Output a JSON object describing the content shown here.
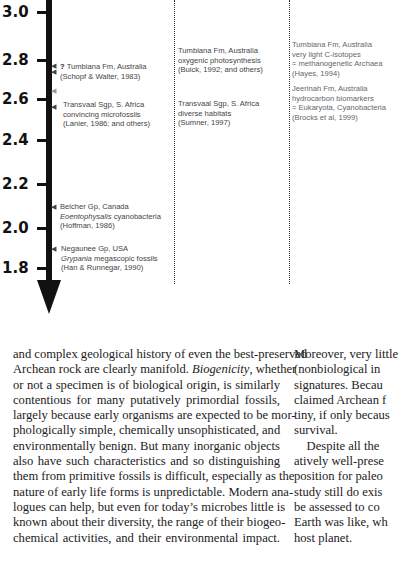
{
  "figure": {
    "axis": {
      "ticks": [
        {
          "label": "3.0",
          "y": 12
        },
        {
          "label": "2.8",
          "y": 60
        },
        {
          "label": "2.6",
          "y": 99
        },
        {
          "label": "2.4",
          "y": 140
        },
        {
          "label": "2.2",
          "y": 184
        },
        {
          "label": "2.0",
          "y": 228
        },
        {
          "label": "1.8",
          "y": 268
        }
      ]
    },
    "column1": {
      "tumbiana": {
        "question_mark": "?",
        "line1": "Tumbiana Fm, Australia",
        "line2": "(Schopf & Walter, 1983)"
      },
      "transvaal": {
        "line1": "Transvaal Sgp, S. Africa",
        "line2": "convincing microfossils",
        "line3": "(Lanier, 1986; and others)"
      },
      "belcher": {
        "line1": "Belcher Gp, Canada",
        "line2_italic": "Eoentophysalis",
        "line2_rest": " cyanobacteria",
        "line3": "(Hoffman, 1986)"
      },
      "negaunee": {
        "line1": "Negaunee Gp, USA",
        "line2_italic": "Grypania",
        "line2_rest": " megascopic fossils",
        "line3": "(Han & Runnegar, 1990)"
      }
    },
    "column2": {
      "tumbiana": {
        "line1": "Tumbiana Fm, Australia",
        "line2": "oxygenic photosynthesis",
        "line3": "(Buick, 1992; and others)"
      },
      "transvaal": {
        "line1": "Transvaal Sgp, S. Africa",
        "line2": "diverse habitats",
        "line3": "(Sumner, 1997)"
      }
    },
    "column3": {
      "tumbiana": {
        "line1": "Tumbiana Fm, Australia",
        "line2": "very light C-isotopes",
        "line3": " = methanogenetic Archaea",
        "line4": "(Hayes, 1994)"
      },
      "jeerinah": {
        "line1": "Jeerinah Fm, Australia",
        "line2": "hydrocarbon biomarkers",
        "line3": "= Eukaryota, Cyanobacteria",
        "line4": "(Brocks et al, 1999)"
      }
    }
  },
  "body_text": {
    "left_column": {
      "line1": "and complex geological history of even the best-preserved",
      "line2_pre": "Archean rock are clearly manifold. ",
      "line2_italic": "Biogenicity",
      "line2_post": ", whether",
      "line3": "or not a specimen is of biological origin, is similarly",
      "line4": "contentious for many putatively primordial fossils,",
      "line5": "largely because early organisms are expected to be mor-",
      "line6": "phologically simple, chemically unsophisticated, and",
      "line7": "environmentally benign. But many inorganic objects",
      "line8": "also have such characteristics and so distinguishing",
      "line9": "them from primitive fossils is difficult, especially as the",
      "line10": "nature of early life forms is unpredictable. Modern ana-",
      "line11": "logues can help, but even for today’s microbes little is",
      "line12": "known about their diversity, the range of their biogeo-",
      "line13": "chemical activities, and their environmental impact."
    },
    "right_column": {
      "line1": "Moreover, very little",
      "line2": "(nonbiological in",
      "line3": "signatures. Becau",
      "line4": "claimed Archean f",
      "line5": "tiny, if only becaus",
      "line6": "survival.",
      "line7": "    Despite all the",
      "line8": "atively well-prese",
      "line9": "position for paleo",
      "line10": "study still do exis",
      "line11": "be assessed to co",
      "line12": "Earth was like, wh",
      "line13": "host planet."
    }
  }
}
